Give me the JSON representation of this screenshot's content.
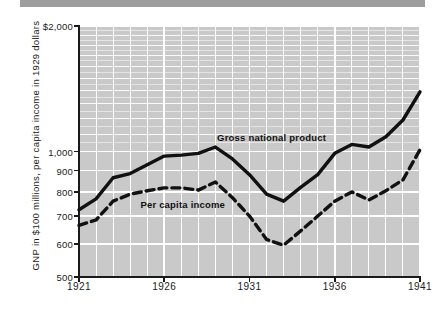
{
  "figure": {
    "banner": {
      "name": "top-banner",
      "color": "#9d9d9d"
    },
    "background_color": "#ffffff",
    "plot_background_color": "#c9c9c9",
    "gridline_color": "#ffffff",
    "axis_color": "#1a1a1a"
  },
  "chart_data": {
    "type": "line",
    "title": "",
    "xlabel": "",
    "ylabel": "GNP in $100 millions, per capita income in 1929 dollars",
    "yscale": "log",
    "ylim": [
      500,
      2000
    ],
    "xlim": [
      1921,
      1941
    ],
    "grid": true,
    "legend_position": "inline-labels",
    "ytick_labels": [
      "$2,000",
      "1,000",
      "900",
      "800",
      "700",
      "600",
      "500"
    ],
    "ytick_values": [
      2000,
      1000,
      900,
      800,
      700,
      600,
      500
    ],
    "xtick_labels": [
      "1921",
      "1926",
      "1931",
      "1936",
      "1941"
    ],
    "xtick_values": [
      1921,
      1926,
      1931,
      1936,
      1941
    ],
    "x": [
      1921,
      1922,
      1923,
      1924,
      1925,
      1926,
      1927,
      1928,
      1929,
      1930,
      1931,
      1932,
      1933,
      1934,
      1935,
      1936,
      1937,
      1938,
      1939,
      1940,
      1941
    ],
    "series": [
      {
        "name": "Gross national product",
        "style": "solid",
        "color": "#111111",
        "label_x": 1929.1,
        "label_y": 1075,
        "values": [
          725,
          770,
          865,
          885,
          930,
          975,
          980,
          990,
          1025,
          960,
          880,
          790,
          760,
          820,
          880,
          990,
          1040,
          1025,
          1085,
          1190,
          1390
        ]
      },
      {
        "name": "Per capita income",
        "style": "dashed",
        "color": "#111111",
        "label_x": 1924.6,
        "label_y": 745,
        "values": [
          665,
          685,
          760,
          790,
          805,
          818,
          818,
          808,
          845,
          775,
          700,
          615,
          596,
          645,
          700,
          760,
          800,
          765,
          805,
          855,
          1010
        ]
      }
    ]
  }
}
